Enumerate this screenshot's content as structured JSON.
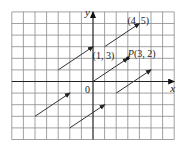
{
  "figure": {
    "type": "equivalent-vectors-on-grid",
    "axes": {
      "x_label": "x",
      "y_label": "y",
      "origin_label": "0"
    },
    "grid": {
      "x_min": -7,
      "x_max": 7,
      "y_min": -5,
      "y_max": 6
    },
    "colors": {
      "grid": "#8a8a8a",
      "axis": "#222222",
      "vector": "#333333",
      "background": "#ffffff"
    },
    "point_labels": [
      {
        "text": "(4, 5)",
        "x": 4,
        "y": 5
      },
      {
        "text": "(1, 3)",
        "x": 1,
        "y": 3
      },
      {
        "text": "P(3, 2)",
        "x": 3,
        "y": 2
      }
    ],
    "vectors": [
      {
        "from": [
          1,
          3
        ],
        "to": [
          4,
          5
        ]
      },
      {
        "from": [
          -3,
          1
        ],
        "to": [
          0,
          3
        ]
      },
      {
        "from": [
          0,
          0
        ],
        "to": [
          3,
          2
        ]
      },
      {
        "from": [
          2,
          -1
        ],
        "to": [
          5,
          1
        ]
      },
      {
        "from": [
          -5,
          -3
        ],
        "to": [
          -2,
          -1
        ]
      },
      {
        "from": [
          -2,
          -4
        ],
        "to": [
          1,
          -2
        ]
      }
    ],
    "point_P": {
      "x": 3,
      "y": 2
    }
  }
}
